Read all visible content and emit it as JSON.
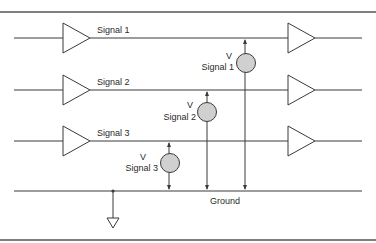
{
  "diagram": {
    "title": "",
    "signals": [
      {
        "label": "Signal 1",
        "y": 38
      },
      {
        "label": "Signal 2",
        "y": 90
      },
      {
        "label": "Signal 3",
        "y": 141
      }
    ],
    "ground": {
      "label": "Ground",
      "y": 191
    },
    "voltmeters": [
      {
        "symbol": "V",
        "label": "Signal 1",
        "x": 245,
        "from_signal": "Signal 1"
      },
      {
        "symbol": "V",
        "label": "Signal 2",
        "x": 207,
        "from_signal": "Signal 2"
      },
      {
        "symbol": "V",
        "label": "Signal 3",
        "x": 169,
        "from_signal": "Signal 3"
      }
    ],
    "colors": {
      "line": "#3a3a3a",
      "meter_fill": "#d0d0d0",
      "background": "#ffffff"
    }
  }
}
